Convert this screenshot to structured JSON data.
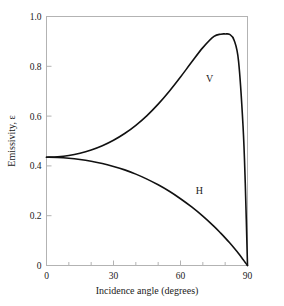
{
  "chart_data": {
    "type": "line",
    "title": "",
    "xlabel": "Incidence angle (degrees)",
    "ylabel": "Emissivity, ε",
    "xlim": [
      0,
      90
    ],
    "ylim": [
      0,
      1.0
    ],
    "grid": false,
    "legend": "inline-curve-labels",
    "xticks": [
      0,
      30,
      60,
      90
    ],
    "xtick_labels": [
      "0",
      "30",
      "60",
      "90"
    ],
    "xminor_ticks": [
      10,
      20,
      40,
      50,
      70,
      80
    ],
    "yticks": [
      0,
      0.2,
      0.4,
      0.6,
      0.8,
      1.0
    ],
    "ytick_labels": [
      "0",
      "0.2",
      "0.4",
      "0.6",
      "0.8",
      "1.0"
    ],
    "line_color": "#111111",
    "axis_color": "#b3b3b3",
    "background_color": "#ffffff",
    "x": [
      0,
      5,
      10,
      15,
      20,
      25,
      30,
      35,
      40,
      45,
      50,
      55,
      60,
      65,
      70,
      75,
      78,
      80,
      82,
      84,
      86,
      88,
      89,
      90
    ],
    "series": [
      {
        "name": "V",
        "label": "V",
        "label_x": 73,
        "label_y": 0.735,
        "values": [
          0.435,
          0.437,
          0.442,
          0.451,
          0.464,
          0.481,
          0.503,
          0.53,
          0.563,
          0.602,
          0.648,
          0.7,
          0.757,
          0.817,
          0.875,
          0.92,
          0.929,
          0.93,
          0.928,
          0.905,
          0.82,
          0.56,
          0.33,
          0.0
        ]
      },
      {
        "name": "H",
        "label": "H",
        "label_x": 68.5,
        "label_y": 0.288,
        "values": [
          0.435,
          0.434,
          0.431,
          0.426,
          0.419,
          0.41,
          0.398,
          0.384,
          0.367,
          0.347,
          0.324,
          0.298,
          0.268,
          0.235,
          0.198,
          0.157,
          0.13,
          0.111,
          0.091,
          0.07,
          0.048,
          0.024,
          0.012,
          0.0
        ]
      }
    ],
    "annotations": [
      {
        "text": "V",
        "x": 73,
        "y": 0.735
      },
      {
        "text": "H",
        "x": 68.5,
        "y": 0.288
      }
    ]
  },
  "figure": {
    "caption": ""
  }
}
